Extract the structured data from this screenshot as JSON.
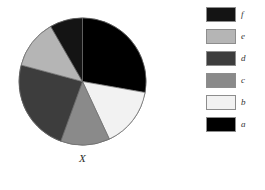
{
  "chart_data": {
    "type": "pie",
    "title": "",
    "xlabel": "X",
    "ylabel": "",
    "categories": [
      "a",
      "b",
      "c",
      "d",
      "e",
      "f"
    ],
    "values": [
      100,
      55,
      45,
      85,
      45,
      30
    ],
    "value_unit": "degrees",
    "percentages": [
      27.8,
      15.3,
      12.5,
      23.6,
      12.5,
      8.3
    ],
    "start_angle_deg": 0,
    "direction": "clockwise",
    "colors": {
      "a": "#000000",
      "b": "#f2f2f2",
      "c": "#8a8a8a",
      "d": "#3d3d3d",
      "e": "#b5b5b5",
      "f": "#141414"
    },
    "slice_border_color": "#6b6b6b",
    "legend": {
      "position": "right",
      "order": [
        "f",
        "e",
        "d",
        "c",
        "b",
        "a"
      ],
      "entries": [
        {
          "label": "f",
          "color": "#141414"
        },
        {
          "label": "e",
          "color": "#b5b5b5"
        },
        {
          "label": "d",
          "color": "#3d3d3d"
        },
        {
          "label": "c",
          "color": "#8a8a8a"
        },
        {
          "label": "b",
          "color": "#f2f2f2"
        },
        {
          "label": "a",
          "color": "#000000"
        }
      ]
    },
    "grid": false,
    "background": "#ffffff"
  },
  "plot": {
    "axis_label": "X"
  }
}
